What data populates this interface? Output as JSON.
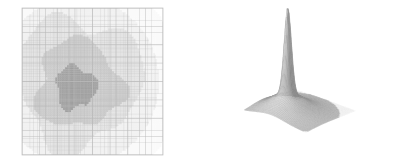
{
  "figure": {
    "title": "",
    "background_color": "#ffffff",
    "width": 396,
    "height": 163,
    "panel_count": 2
  },
  "panels": [
    {
      "id": "amr-grid",
      "name": "adaptive-mesh-refinement-grid",
      "caption": "",
      "type": "2d-mesh-plot",
      "plot_box": {
        "x": 22,
        "y": 8,
        "width": 141,
        "height": 147
      },
      "line_color": "#c8c8c8",
      "frame_color": "#bdbdbd"
    },
    {
      "id": "surface-plot",
      "name": "three-d-surface-mesh-plot",
      "caption": "",
      "type": "3d-surface-mesh",
      "line_color": "#8c8c8c",
      "peak_apex": {
        "x": 262,
        "y": 33
      }
    }
  ],
  "chart_data": [
    {
      "type": "heatmap",
      "name": "adaptive-mesh-refinement-grid",
      "title": "",
      "subtitle": "",
      "xlabel": "",
      "ylabel": "",
      "xlim": [
        0,
        1
      ],
      "ylim": [
        0,
        1
      ],
      "grid": true,
      "legend": "none",
      "description": "Adaptive mesh refinement grid with nested rectangular cells; cell shading increases toward the centre where refinement is finest.",
      "colorscale": [
        "#ffffff",
        "#ececec",
        "#dcdcdc",
        "#c4c4c4",
        "#a8a8a8",
        "#969696"
      ],
      "refinement_levels": [
        {
          "level": 0,
          "cell_size": 0.125,
          "shade": "#ffffff",
          "label": "base grid"
        },
        {
          "level": 1,
          "cell_size": 0.0625,
          "shade": "#f2f2f2",
          "label": "level 1"
        },
        {
          "level": 2,
          "cell_size": 0.03125,
          "shade": "#e4e4e4",
          "label": "level 2"
        },
        {
          "level": 3,
          "cell_size": 0.015625,
          "shade": "#d2d2d2",
          "label": "level 3"
        },
        {
          "level": 4,
          "cell_size": 0.0078125,
          "shade": "#b4b4b4",
          "label": "level 4"
        },
        {
          "level": 5,
          "cell_size": 0.00390625,
          "shade": "#969696",
          "label": "level 5"
        }
      ],
      "regions": [
        {
          "name": "outer-light-region",
          "shade": "#ececec",
          "center": [
            0.4,
            0.5
          ],
          "radius": 0.44
        },
        {
          "name": "mid-gray-region",
          "shade": "#d4d4d4",
          "center": [
            0.4,
            0.52
          ],
          "radius": 0.3
        },
        {
          "name": "inner-core-region",
          "shade": "#9c9c9c",
          "center": [
            0.38,
            0.54
          ],
          "radius": 0.145
        }
      ]
    },
    {
      "type": "surface",
      "name": "three-d-surface-mesh-plot",
      "title": "",
      "subtitle": "",
      "xlabel": "",
      "ylabel": "",
      "zlabel": "",
      "grid": true,
      "legend": "none",
      "description": "Three-dimensional wireframe/mesh rendering of a sharply peaked radially symmetric function over a square domain, viewed in oblique projection. A narrow high-amplitude spike rises from a broad low plateau.",
      "xlim": [
        0,
        1
      ],
      "ylim": [
        0,
        1
      ],
      "zlim": [
        0,
        1
      ],
      "surface": {
        "peak_height": 1.0,
        "peak_location": [
          0.36,
          0.42
        ],
        "plateau_height": 0.18,
        "plateau_radius": 0.33,
        "base_height": 0.0,
        "mesh_nx": 56,
        "mesh_ny": 56
      },
      "shading": {
        "highlight": "#f4f4f4",
        "midtone": "#a6a6a6",
        "shadow": "#5a5a5a",
        "mesh_line": "#9a9a9a",
        "flat_mesh_line": "#d8d8d8"
      },
      "view": {
        "azimuth": -55,
        "elevation": 28
      }
    }
  ]
}
